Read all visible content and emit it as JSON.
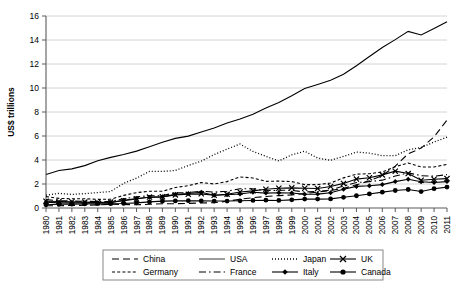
{
  "chart_data": {
    "type": "line",
    "title": "",
    "xlabel": "",
    "ylabel": "US$ trillions",
    "ylim": [
      0,
      16
    ],
    "ytick_step": 2,
    "yticks": [
      "0",
      "2",
      "4",
      "6",
      "8",
      "10",
      "12",
      "14",
      "16"
    ],
    "grid": true,
    "legend_position": "bottom",
    "x": [
      1980,
      1981,
      1982,
      1983,
      1984,
      1985,
      1986,
      1987,
      1988,
      1989,
      1990,
      1991,
      1992,
      1993,
      1994,
      1995,
      1996,
      1997,
      1998,
      1999,
      2000,
      2001,
      2002,
      2003,
      2004,
      2005,
      2006,
      2007,
      2008,
      2009,
      2010,
      2011
    ],
    "categories": [
      "1980",
      "1981",
      "1982",
      "1983",
      "1984",
      "1985",
      "1986",
      "1987",
      "1988",
      "1989",
      "1990",
      "1991",
      "1992",
      "1993",
      "1994",
      "1995",
      "1996",
      "1997",
      "1998",
      "1999",
      "2000",
      "2001",
      "2002",
      "2003",
      "2004",
      "2005",
      "2006",
      "2007",
      "2008",
      "2009",
      "2010",
      "2011"
    ],
    "series": [
      {
        "name": "China",
        "style": "long-dash",
        "marker": "none",
        "color": "#000000",
        "values": [
          0.19,
          0.19,
          0.21,
          0.23,
          0.26,
          0.31,
          0.3,
          0.27,
          0.31,
          0.35,
          0.36,
          0.38,
          0.42,
          0.44,
          0.56,
          0.73,
          0.86,
          0.96,
          1.03,
          1.09,
          1.2,
          1.33,
          1.46,
          1.64,
          1.93,
          2.26,
          2.71,
          3.49,
          4.52,
          4.99,
          5.93,
          7.32
        ]
      },
      {
        "name": "USA",
        "style": "solid",
        "marker": "none",
        "color": "#4a4a4a",
        "values": [
          2.79,
          3.13,
          3.26,
          3.53,
          3.93,
          4.22,
          4.46,
          4.74,
          5.1,
          5.48,
          5.8,
          5.99,
          6.34,
          6.67,
          7.08,
          7.41,
          7.82,
          8.33,
          8.79,
          9.35,
          9.95,
          10.29,
          10.64,
          11.14,
          11.86,
          12.62,
          13.38,
          14.03,
          14.72,
          14.42,
          14.96,
          15.53
        ]
      },
      {
        "name": "Japan",
        "style": "dotted",
        "marker": "none",
        "color": "#000000",
        "values": [
          1.07,
          1.22,
          1.13,
          1.2,
          1.28,
          1.38,
          2.05,
          2.49,
          3.05,
          3.05,
          3.13,
          3.54,
          3.91,
          4.45,
          4.91,
          5.33,
          4.71,
          4.31,
          3.92,
          4.43,
          4.73,
          4.16,
          3.98,
          4.3,
          4.66,
          4.57,
          4.36,
          4.36,
          4.85,
          5.04,
          5.5,
          5.9
        ]
      },
      {
        "name": "UK",
        "style": "solid",
        "marker": "cross",
        "color": "#000000",
        "values": [
          0.56,
          0.54,
          0.52,
          0.49,
          0.46,
          0.49,
          0.6,
          0.75,
          0.91,
          0.93,
          1.09,
          1.14,
          1.18,
          1.06,
          1.14,
          1.33,
          1.43,
          1.56,
          1.65,
          1.68,
          1.65,
          1.63,
          1.79,
          2.05,
          2.41,
          2.52,
          2.76,
          3.07,
          2.87,
          2.31,
          2.4,
          2.45
        ]
      },
      {
        "name": "Germany",
        "style": "short-dash",
        "marker": "none",
        "color": "#000000",
        "values": [
          0.95,
          0.8,
          0.77,
          0.77,
          0.72,
          0.73,
          1.05,
          1.28,
          1.4,
          1.39,
          1.71,
          1.86,
          2.12,
          2.0,
          2.2,
          2.59,
          2.5,
          2.22,
          2.24,
          2.2,
          1.95,
          1.95,
          2.08,
          2.51,
          2.82,
          2.86,
          3.0,
          3.44,
          3.75,
          3.42,
          3.42,
          3.63
        ]
      },
      {
        "name": "France",
        "style": "dash-dot",
        "marker": "none",
        "color": "#000000",
        "values": [
          0.7,
          0.61,
          0.58,
          0.56,
          0.53,
          0.55,
          0.77,
          0.94,
          1.02,
          1.03,
          1.27,
          1.28,
          1.4,
          1.33,
          1.4,
          1.61,
          1.6,
          1.44,
          1.48,
          1.47,
          1.33,
          1.38,
          1.49,
          1.84,
          2.12,
          2.2,
          2.32,
          2.66,
          2.93,
          2.69,
          2.65,
          2.78
        ]
      },
      {
        "name": "Italy",
        "style": "solid",
        "marker": "diamond",
        "color": "#000000",
        "values": [
          0.48,
          0.43,
          0.43,
          0.44,
          0.44,
          0.45,
          0.64,
          0.79,
          0.89,
          0.93,
          1.14,
          1.21,
          1.31,
          1.06,
          1.1,
          1.17,
          1.31,
          1.24,
          1.27,
          1.25,
          1.14,
          1.16,
          1.27,
          1.57,
          1.8,
          1.86,
          1.95,
          2.2,
          2.39,
          2.19,
          2.13,
          2.2
        ]
      },
      {
        "name": "Canada",
        "style": "solid",
        "marker": "circle",
        "color": "#000000",
        "values": [
          0.27,
          0.31,
          0.32,
          0.34,
          0.36,
          0.36,
          0.38,
          0.43,
          0.51,
          0.57,
          0.59,
          0.61,
          0.59,
          0.58,
          0.58,
          0.6,
          0.63,
          0.65,
          0.63,
          0.68,
          0.74,
          0.74,
          0.76,
          0.89,
          1.02,
          1.17,
          1.32,
          1.46,
          1.54,
          1.37,
          1.61,
          1.74
        ]
      }
    ]
  },
  "legend": {
    "row1": [
      "China",
      "USA",
      "Japan",
      "UK"
    ],
    "row2": [
      "Germany",
      "France",
      "Italy",
      "Canada"
    ]
  },
  "axes": {
    "y_title": "US$ trillions"
  }
}
